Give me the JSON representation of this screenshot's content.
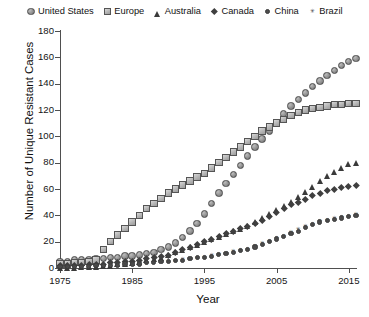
{
  "chart_data": {
    "type": "scatter",
    "title": "",
    "xlabel": "Year",
    "ylabel": "Number of Unique Resistant Cases",
    "xlim": [
      1975,
      2016
    ],
    "ylim": [
      0,
      180
    ],
    "xticks": [
      1975,
      1985,
      1995,
      2005,
      2015
    ],
    "yticks": [
      0,
      20,
      40,
      60,
      80,
      100,
      120,
      140,
      160,
      180
    ],
    "grid": false,
    "legend_position": "top",
    "x": [
      1975,
      1976,
      1977,
      1978,
      1979,
      1980,
      1981,
      1982,
      1983,
      1984,
      1985,
      1986,
      1987,
      1988,
      1989,
      1990,
      1991,
      1992,
      1993,
      1994,
      1995,
      1996,
      1997,
      1998,
      1999,
      2000,
      2001,
      2002,
      2003,
      2004,
      2005,
      2006,
      2007,
      2008,
      2009,
      2010,
      2011,
      2012,
      2013,
      2014,
      2015,
      2016
    ],
    "series": [
      {
        "name": "United States",
        "marker": "circle",
        "values": [
          5,
          5,
          6,
          6,
          6,
          7,
          7,
          8,
          8,
          9,
          9,
          10,
          11,
          12,
          14,
          16,
          19,
          23,
          28,
          34,
          41,
          49,
          57,
          64,
          71,
          78,
          85,
          92,
          98,
          104,
          110,
          117,
          123,
          128,
          133,
          138,
          142,
          146,
          150,
          154,
          157,
          159
        ]
      },
      {
        "name": "Europe",
        "marker": "square",
        "values": [
          3,
          3,
          4,
          4,
          5,
          6,
          14,
          20,
          25,
          30,
          35,
          40,
          45,
          49,
          53,
          57,
          60,
          63,
          66,
          69,
          72,
          76,
          80,
          84,
          88,
          92,
          96,
          100,
          104,
          107,
          110,
          113,
          116,
          118,
          120,
          121,
          122,
          123,
          124,
          124,
          125,
          125
        ]
      },
      {
        "name": "Australia",
        "marker": "triangle",
        "values": [
          2,
          2,
          2,
          3,
          3,
          3,
          4,
          4,
          5,
          5,
          6,
          7,
          8,
          9,
          10,
          12,
          14,
          16,
          18,
          20,
          22,
          24,
          26,
          28,
          30,
          32,
          34,
          37,
          40,
          43,
          46,
          49,
          52,
          56,
          60,
          64,
          68,
          72,
          75,
          78,
          81,
          82
        ]
      },
      {
        "name": "Canada",
        "marker": "diamond",
        "values": [
          2,
          2,
          2,
          2,
          3,
          3,
          3,
          4,
          4,
          5,
          5,
          6,
          7,
          8,
          9,
          10,
          12,
          14,
          16,
          18,
          20,
          22,
          24,
          26,
          28,
          30,
          32,
          34,
          36,
          39,
          42,
          45,
          48,
          50,
          52,
          55,
          57,
          59,
          60,
          61,
          62,
          63
        ]
      },
      {
        "name": "China",
        "marker": "dot",
        "values": [
          1,
          1,
          1,
          1,
          1,
          2,
          2,
          2,
          2,
          3,
          3,
          3,
          4,
          4,
          5,
          5,
          6,
          6,
          7,
          8,
          8,
          9,
          10,
          11,
          12,
          13,
          14,
          16,
          18,
          20,
          22,
          24,
          26,
          28,
          31,
          33,
          35,
          36,
          37,
          38,
          39,
          40
        ]
      },
      {
        "name": "Brazil",
        "marker": "x",
        "values": [
          1,
          1,
          1,
          1,
          1,
          1,
          2,
          2,
          2,
          2,
          3,
          3,
          3,
          4,
          4,
          5,
          5,
          6,
          6,
          7,
          8,
          9,
          10,
          11,
          12,
          13,
          14,
          16,
          18,
          20,
          22,
          24,
          27,
          29,
          31,
          33,
          35,
          36,
          37,
          38,
          39,
          40
        ]
      }
    ]
  },
  "legend": {
    "items": [
      {
        "label": "United States",
        "marker": "circle"
      },
      {
        "label": "Europe",
        "marker": "square"
      },
      {
        "label": "Australia",
        "marker": "triangle"
      },
      {
        "label": "Canada",
        "marker": "diamond"
      },
      {
        "label": "China",
        "marker": "dot"
      },
      {
        "label": "Brazil",
        "marker": "x"
      }
    ]
  },
  "colors": {
    "axis": "#4f4f4f",
    "text": "#121212",
    "marker_light": "#b4b4b4",
    "marker_dark": "#3f3f3f",
    "background": "#ffffff"
  }
}
